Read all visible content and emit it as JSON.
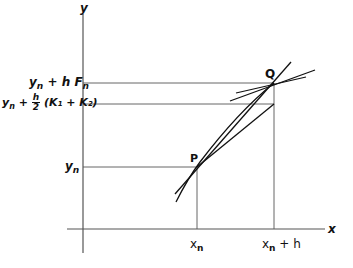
{
  "diagram": {
    "axes": {
      "x_label": "x",
      "y_label": "y"
    },
    "points": {
      "P": "P",
      "Q": "Q"
    },
    "x_ticks": {
      "xn": "x",
      "xn_sub": "n",
      "xnh_sub": "n",
      "xnh_suffix": " + h"
    },
    "y_ticks": {
      "yn_base": "y",
      "yn_sub": "n",
      "top_prefix_sub": "n",
      "top_suffix": " + h F",
      "top_suffix_sub": "n",
      "mid_sub": "n",
      "mid_plus": " + ",
      "mid_num": "h",
      "mid_den": "2",
      "mid_tail": " (K₁ + K₂)"
    },
    "colors": {
      "line": "#111111",
      "guide": "#555555"
    }
  }
}
